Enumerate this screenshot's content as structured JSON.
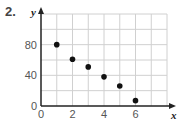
{
  "problem_number": "2.",
  "chart_data": {
    "type": "scatter",
    "title": "",
    "xlabel": "x",
    "ylabel": "y",
    "xlim": [
      0,
      8
    ],
    "ylim": [
      0,
      120
    ],
    "x_ticks": [
      0,
      2,
      4,
      6
    ],
    "y_ticks": [
      0,
      40,
      80
    ],
    "grid": true,
    "x": [
      1,
      2,
      3,
      4,
      5,
      6
    ],
    "y": [
      80,
      61,
      51,
      38,
      26,
      7
    ],
    "point_color": "#111111"
  }
}
